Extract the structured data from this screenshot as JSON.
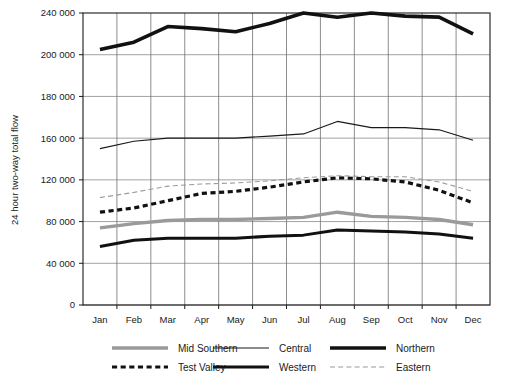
{
  "chart_data": {
    "type": "line",
    "title": "",
    "xlabel": "",
    "ylabel": "24 hour two-way total flow",
    "categories": [
      "Jan",
      "Feb",
      "Mar",
      "Apr",
      "May",
      "Jun",
      "Jul",
      "Aug",
      "Sep",
      "Oct",
      "Nov",
      "Dec"
    ],
    "ytick_labels": [
      "240 000",
      "200 000",
      "180 000",
      "160 000",
      "120 000",
      "80 000",
      "40 000",
      "0"
    ],
    "ytick_values": [
      240000,
      200000,
      180000,
      160000,
      120000,
      80000,
      40000,
      0
    ],
    "ylim": [
      0,
      240000
    ],
    "grid": "both",
    "legend_position": "bottom",
    "series": [
      {
        "name": "Mid Southern",
        "color": "#9a9a9a",
        "width": 3.4,
        "dash": "none",
        "values": [
          74000,
          78000,
          81000,
          82000,
          82000,
          83000,
          84000,
          89000,
          85000,
          84000,
          82000,
          77000
        ]
      },
      {
        "name": "Central",
        "color": "#1a1a1a",
        "width": 1.2,
        "dash": "none",
        "values": [
          150000,
          157000,
          160000,
          160000,
          160000,
          161000,
          162000,
          168000,
          165000,
          165000,
          164000,
          158000
        ]
      },
      {
        "name": "Northern",
        "color": "#111111",
        "width": 3.6,
        "dash": "none",
        "values": [
          205000,
          212000,
          227000,
          225000,
          222000,
          230000,
          241000,
          236000,
          242000,
          237000,
          236000,
          220000
        ]
      },
      {
        "name": "Test Valley",
        "color": "#111111",
        "width": 3.2,
        "dash": "dashed",
        "values": [
          89000,
          93000,
          100000,
          107000,
          109000,
          113000,
          118000,
          122000,
          121000,
          118000,
          110000,
          98000
        ]
      },
      {
        "name": "Western",
        "color": "#111111",
        "width": 3.0,
        "dash": "none",
        "values": [
          56000,
          62000,
          64000,
          64000,
          64000,
          66000,
          67000,
          72000,
          71000,
          70000,
          68000,
          64000
        ]
      },
      {
        "name": "Eastern",
        "color": "#9a9a9a",
        "width": 1.1,
        "dash": "dashed",
        "values": [
          103000,
          108000,
          114000,
          116000,
          117000,
          119000,
          122000,
          124000,
          123000,
          123000,
          118000,
          109000
        ]
      }
    ]
  },
  "legend": {
    "items": [
      {
        "label": "Mid Southern"
      },
      {
        "label": "Central"
      },
      {
        "label": "Northern"
      },
      {
        "label": "Test Valley"
      },
      {
        "label": "Western"
      },
      {
        "label": "Eastern"
      }
    ]
  },
  "caption": {
    "text": ""
  }
}
